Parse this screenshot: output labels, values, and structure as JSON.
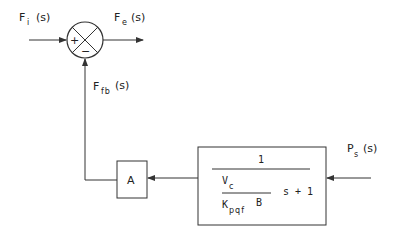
{
  "diagram": {
    "type": "block_diagram",
    "summing_junction": {
      "plus_sign": "+",
      "minus_sign": "−"
    },
    "signals": {
      "input": {
        "main": "F",
        "sub": "i",
        "arg": "(s)"
      },
      "error": {
        "main": "F",
        "sub": "e",
        "arg": "(s)"
      },
      "feedback": {
        "main": "F",
        "sub": "fb",
        "arg": "(s)"
      },
      "pressure": {
        "main": "P",
        "sub": "s",
        "arg": "(s)"
      }
    },
    "blocks": {
      "gain": {
        "label": "A"
      },
      "transfer_function": {
        "numerator": "1",
        "inner_numerator_main": "V",
        "inner_numerator_sub": "c",
        "inner_denominator_main": "K",
        "inner_denominator_sub": "pqf",
        "inner_denominator_tail": "B",
        "tail": "s + 1"
      }
    },
    "colors": {
      "line": "#333333",
      "background": "#ffffff"
    }
  }
}
